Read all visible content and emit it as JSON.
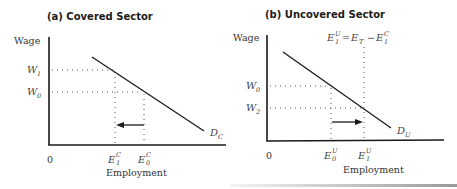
{
  "panels": [
    {
      "id": "a",
      "title": "(a) Covered Sector",
      "y_axis_label": "Wage",
      "x_axis_label": "Employment",
      "origin_label": "0",
      "wage_labels": [
        {
          "main": "W",
          "sub": "1"
        },
        {
          "main": "W",
          "sub": "0"
        }
      ],
      "employment_labels": [
        {
          "main": "E",
          "sub": "1",
          "sup": "C"
        },
        {
          "main": "E",
          "sub": "0",
          "sup": "C"
        }
      ],
      "demand_label": {
        "main": "D",
        "sub": "C"
      },
      "arrow_direction": "left"
    },
    {
      "id": "b",
      "title": "(b) Uncovered Sector",
      "y_axis_label": "Wage",
      "x_axis_label": "Employment",
      "origin_label": "0",
      "wage_labels": [
        {
          "main": "W",
          "sub": "0"
        },
        {
          "main": "W",
          "sub": "2"
        }
      ],
      "employment_labels": [
        {
          "main": "E",
          "sub": "0",
          "sup": "U"
        },
        {
          "main": "E",
          "sub": "1",
          "sup": "U"
        }
      ],
      "demand_label": {
        "main": "D",
        "sub": "U"
      },
      "arrow_direction": "right",
      "equation": {
        "lhs_main": "E",
        "lhs_sub": "1",
        "lhs_sup": "U",
        "equals": "=",
        "t_main": "E",
        "t_sub": "T",
        "minus": "−",
        "rhs_main": "E",
        "rhs_sub": "1",
        "rhs_sup": "C"
      }
    }
  ],
  "colors": {
    "line": "#1a1a1a",
    "dotted": "#555555",
    "text": "#333333"
  }
}
